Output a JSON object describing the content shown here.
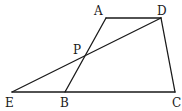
{
  "diagram": {
    "type": "geometry",
    "points": {
      "A": {
        "label": "A",
        "x": 106,
        "y": 18
      },
      "D": {
        "label": "D",
        "x": 161,
        "y": 18
      },
      "B": {
        "label": "B",
        "x": 65,
        "y": 92
      },
      "C": {
        "label": "C",
        "x": 175,
        "y": 92
      },
      "E": {
        "label": "E",
        "x": 12,
        "y": 92
      },
      "P": {
        "label": "P",
        "x": 84,
        "y": 57
      }
    },
    "segments": [
      {
        "name": "AD",
        "from": "A",
        "to": "D"
      },
      {
        "name": "DC",
        "from": "D",
        "to": "C"
      },
      {
        "name": "EC",
        "from": "E",
        "to": "C"
      },
      {
        "name": "AB",
        "from": "A",
        "to": "B"
      },
      {
        "name": "DE",
        "from": "D",
        "to": "E"
      }
    ],
    "labels": {
      "A": "A",
      "D": "D",
      "P": "P",
      "E": "E",
      "B": "B",
      "C": "C"
    },
    "colors": {
      "stroke": "#1a1a1a",
      "background": "#ffffff"
    }
  }
}
